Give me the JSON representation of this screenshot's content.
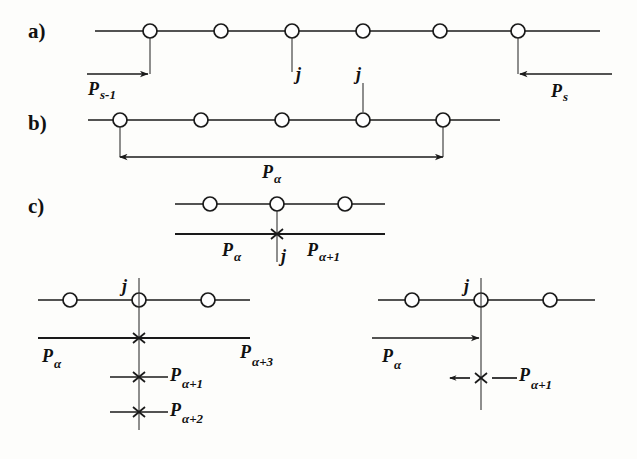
{
  "figure": {
    "background_color": "#fdfdfb",
    "ink_color": "#1a1a1a",
    "panels": [
      {
        "id": "a",
        "label": "a)"
      },
      {
        "id": "b",
        "label": "b)"
      },
      {
        "id": "c",
        "label": "c)"
      }
    ]
  },
  "panel_a": {
    "label": "a)",
    "node_count": 6,
    "node_label": "node-circle",
    "j_labels": [
      "j"
    ],
    "left_measure": {
      "text": "P",
      "sub": "s-1",
      "direction": "right"
    },
    "right_measure": {
      "text": "P",
      "sub": "s",
      "direction": "left"
    }
  },
  "panel_b": {
    "label": "b)",
    "node_count": 5,
    "j_labels": [
      "j"
    ],
    "span_measure": {
      "text": "P",
      "sub": "α",
      "direction": "both"
    }
  },
  "panel_c": {
    "label": "c)",
    "top": {
      "node_count": 3,
      "j_label": "j",
      "left_measure": {
        "text": "P",
        "sub": "α"
      },
      "right_measure": {
        "text": "P",
        "sub": "α+1"
      }
    },
    "bottom_left": {
      "node_count": 3,
      "j_label": "j",
      "measures": [
        {
          "text": "P",
          "sub": "α"
        },
        {
          "text": "P",
          "sub": "α+3"
        },
        {
          "text": "P",
          "sub": "α+1"
        },
        {
          "text": "P",
          "sub": "α+2"
        }
      ]
    },
    "bottom_right": {
      "node_count": 3,
      "j_label": "j",
      "measures": [
        {
          "text": "P",
          "sub": "α",
          "direction": "right"
        },
        {
          "text": "P",
          "sub": "α+1",
          "direction": "none"
        }
      ]
    }
  },
  "glyphs": {
    "alpha": "α",
    "j": "j",
    "P": "P"
  }
}
